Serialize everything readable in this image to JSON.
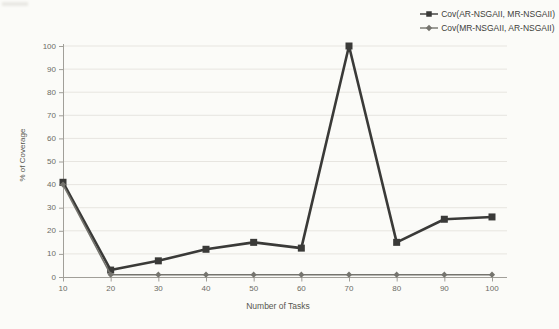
{
  "chart_data": {
    "type": "line",
    "title": "",
    "xlabel": "Number of Tasks",
    "ylabel": "% of Coverage",
    "x": [
      10,
      20,
      30,
      40,
      50,
      60,
      70,
      80,
      90,
      100
    ],
    "xticks": [
      10,
      20,
      30,
      40,
      50,
      60,
      70,
      80,
      90,
      100
    ],
    "yticks": [
      0,
      10,
      20,
      30,
      40,
      50,
      60,
      70,
      80,
      90,
      100
    ],
    "ylim": [
      0,
      100
    ],
    "xlim": [
      10,
      100
    ],
    "grid": "horizontal",
    "legend_position": "top-right",
    "series": [
      {
        "name": "Cov(AR-NSGAII, MR-NSGAII)",
        "marker": "square",
        "color": "#3a3a38",
        "line_width": 2.6,
        "values": [
          41,
          3,
          7,
          12,
          15,
          12.5,
          100,
          15,
          25,
          26
        ]
      },
      {
        "name": "Cov(MR-NSGAII, AR-NSGAII)",
        "marker": "diamond",
        "color": "#75746e",
        "line_width": 1.6,
        "values": [
          40,
          1,
          1,
          1,
          1,
          1,
          1,
          1,
          1,
          1
        ]
      }
    ]
  },
  "colors": {
    "background": "#fbfbf8",
    "gridline": "#e7e5e0",
    "axis": "#a19f99",
    "tick_text": "#6b6b65",
    "title_text": "#57564f",
    "legend_text": "#3e3e3a"
  }
}
